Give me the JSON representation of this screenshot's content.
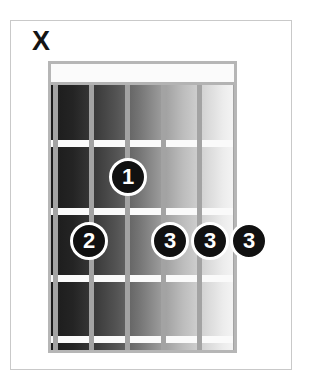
{
  "diagram": {
    "type": "guitar-chord-diagram",
    "string_count": 6,
    "fret_count": 4,
    "nut_shown": true,
    "colors": {
      "frame_border": "#c9c9c9",
      "board_border": "#b6b6b6",
      "fret_line": "#fafafa",
      "string_line": "#a3a3a3",
      "nut_fill": "#fbfbfb",
      "dot_fill": "#111111",
      "dot_ring": "#ffffff",
      "dot_text": "#ffffff",
      "mute_marker": "#141414",
      "board_gradient_dark": "#1b1b1b",
      "board_gradient_light": "#f4f4f4",
      "background": "#ffffff"
    },
    "string_markers": [
      {
        "string": 1,
        "symbol": "X",
        "meaning": "muted"
      }
    ],
    "fingerings": [
      {
        "string": 3,
        "fret": 2,
        "finger": "1"
      },
      {
        "string": 2,
        "fret": 3,
        "finger": "2"
      },
      {
        "string": 4,
        "fret": 3,
        "finger": "3"
      },
      {
        "string": 5,
        "fret": 3,
        "finger": "3"
      },
      {
        "string": 6,
        "fret": 3,
        "finger": "3"
      }
    ],
    "geometry": {
      "string_x": [
        52,
        88,
        124,
        160,
        196,
        232
      ],
      "fret_y": [
        140,
        208,
        275,
        336
      ],
      "board": {
        "left": 48,
        "top": 61,
        "width": 189,
        "height": 292
      },
      "nut_height": 21
    }
  }
}
